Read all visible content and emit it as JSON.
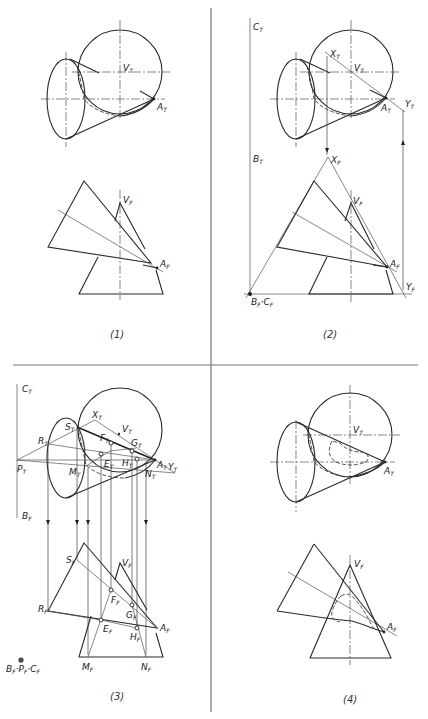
{
  "figure": {
    "panels": [
      {
        "caption": "(1)",
        "top_view_labels": [
          "V",
          "A"
        ],
        "front_view_labels": [
          "V",
          "A"
        ]
      },
      {
        "caption": "(2)",
        "top_view_labels": [
          "C",
          "X",
          "V",
          "A",
          "Y",
          "B"
        ],
        "front_view_labels": [
          "X",
          "V",
          "A",
          "Y",
          "B",
          "C"
        ]
      },
      {
        "caption": "(3)",
        "top_view_labels": [
          "C",
          "X",
          "S",
          "V",
          "R",
          "F",
          "G",
          "E",
          "H",
          "A",
          "Y",
          "P",
          "M",
          "N",
          "B"
        ],
        "front_view_labels": [
          "S",
          "V",
          "F",
          "R",
          "G",
          "E",
          "H",
          "A",
          "M",
          "N"
        ],
        "reference_label": "B P C"
      },
      {
        "caption": "(4)",
        "top_view_labels": [
          "V",
          "A"
        ],
        "front_view_labels": [
          "V",
          "A"
        ]
      }
    ],
    "subscripts": {
      "top": "T",
      "front": "F"
    }
  },
  "labels": {
    "p1": {
      "vt": "V",
      "at": "A",
      "vf": "V",
      "af": "A",
      "caption": "(1)"
    },
    "p2": {
      "ct": "C",
      "xt": "X",
      "vt": "V",
      "at": "A",
      "yt": "Y",
      "bt": "B",
      "xf": "X",
      "vf": "V",
      "af": "A",
      "yf": "Y",
      "bfcf": "B",
      "bfcf2": "C",
      "caption": "(2)"
    },
    "p3": {
      "ct": "C",
      "xt": "X",
      "st": "S",
      "vt": "V",
      "rt": "R",
      "ft": "F",
      "gt": "G",
      "et": "E",
      "ht": "H",
      "at": "A",
      "yt": "Y",
      "pt": "P",
      "mt": "M",
      "nt": "N",
      "bf": "B",
      "sf": "S",
      "vf": "V",
      "ff": "F",
      "rf": "R",
      "gf": "G",
      "ef": "E",
      "hf": "H",
      "af": "A",
      "mf": "M",
      "nf": "N",
      "ref1": "B",
      "ref2": "P",
      "ref3": "C",
      "caption": "(3)"
    },
    "p4": {
      "vt": "V",
      "at": "A",
      "vf": "V",
      "af": "A",
      "caption": "(4)"
    },
    "sub_t": "T",
    "sub_f": "F"
  }
}
